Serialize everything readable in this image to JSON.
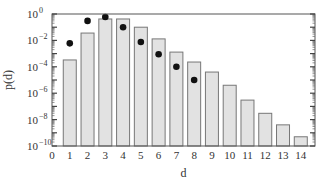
{
  "chart_data": {
    "type": "bar",
    "title": "",
    "xlabel": "d",
    "ylabel": "p(d)",
    "yscale": "log",
    "ylim": [
      1e-10,
      1
    ],
    "xlim": [
      0,
      14.8
    ],
    "grid": false,
    "legend": null,
    "x_ticks": [
      "0",
      "1",
      "2",
      "3",
      "4",
      "5",
      "6",
      "7",
      "8",
      "9",
      "10",
      "11",
      "12",
      "13",
      "14"
    ],
    "y_ticks": [
      {
        "exp": 0,
        "label": "10",
        "sup": "0"
      },
      {
        "exp": -2,
        "label": "10",
        "sup": "−2"
      },
      {
        "exp": -4,
        "label": "10",
        "sup": "−4"
      },
      {
        "exp": -6,
        "label": "10",
        "sup": "−6"
      },
      {
        "exp": -8,
        "label": "10",
        "sup": "−8"
      },
      {
        "exp": -10,
        "label": "10",
        "sup": "−10"
      }
    ],
    "categories": [
      1,
      2,
      3,
      4,
      5,
      6,
      7,
      8,
      9,
      10,
      11,
      12,
      13,
      14
    ],
    "series": [
      {
        "name": "bars",
        "type": "bar",
        "color": "#e2e2e2",
        "edge_color": "#777777",
        "values": [
          0.00033,
          0.036,
          0.42,
          0.42,
          0.1,
          0.013,
          0.0013,
          0.00023,
          4e-05,
          4e-06,
          3e-07,
          3e-08,
          4e-09,
          5e-10
        ]
      },
      {
        "name": "dots",
        "type": "scatter",
        "color": "#111111",
        "x": [
          1,
          2,
          3,
          4,
          5,
          6,
          7,
          8
        ],
        "values": [
          0.006,
          0.3,
          0.6,
          0.1,
          0.0076,
          0.0009,
          0.0001,
          1e-05
        ]
      }
    ]
  }
}
